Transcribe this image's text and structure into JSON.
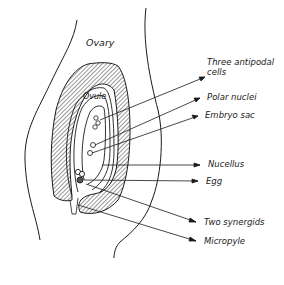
{
  "diagram": {
    "labels": {
      "ovary": "Ovary",
      "ovule": "Ovule",
      "three_antipodal_line1": "Three antipodal",
      "three_antipodal_line2": "cells",
      "polar_nuclei": "Polar nuclei",
      "embryo_sac": "Embryo sac",
      "nucellus": "Nucellus",
      "egg": "Egg",
      "two_synergids": "Two synergids",
      "micropyle": "Micropyle"
    },
    "colors": {
      "ink": "#1a1a1a",
      "background": "#ffffff"
    }
  }
}
